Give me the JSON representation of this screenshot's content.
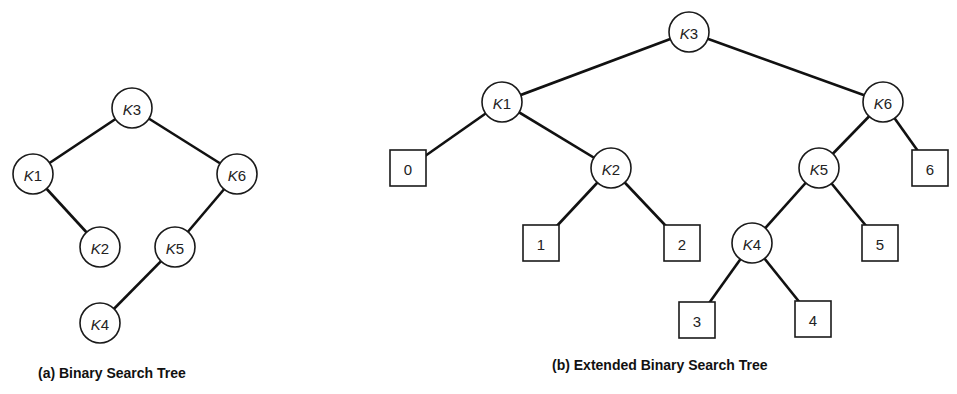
{
  "diagram_a": {
    "caption": "(a) Binary Search Tree",
    "nodes": [
      {
        "id": "K3",
        "prefix": "K",
        "num": "3",
        "x": 132,
        "y": 108
      },
      {
        "id": "K1",
        "prefix": "K",
        "num": "1",
        "x": 33,
        "y": 174
      },
      {
        "id": "K6",
        "prefix": "K",
        "num": "6",
        "x": 237,
        "y": 174
      },
      {
        "id": "K2",
        "prefix": "K",
        "num": "2",
        "x": 100,
        "y": 247
      },
      {
        "id": "K5",
        "prefix": "K",
        "num": "5",
        "x": 175,
        "y": 247
      },
      {
        "id": "K4",
        "prefix": "K",
        "num": "4",
        "x": 100,
        "y": 323
      }
    ],
    "edges": [
      [
        "K3",
        "K1"
      ],
      [
        "K3",
        "K6"
      ],
      [
        "K1",
        "K2"
      ],
      [
        "K6",
        "K5"
      ],
      [
        "K5",
        "K4"
      ]
    ]
  },
  "diagram_b": {
    "caption": "(b) Extended Binary Search Tree",
    "internal_nodes": [
      {
        "id": "K3",
        "prefix": "K",
        "num": "3",
        "x": 689,
        "y": 32
      },
      {
        "id": "K1",
        "prefix": "K",
        "num": "1",
        "x": 502,
        "y": 102
      },
      {
        "id": "K6",
        "prefix": "K",
        "num": "6",
        "x": 883,
        "y": 102
      },
      {
        "id": "K2",
        "prefix": "K",
        "num": "2",
        "x": 611,
        "y": 168
      },
      {
        "id": "K5",
        "prefix": "K",
        "num": "5",
        "x": 819,
        "y": 168
      },
      {
        "id": "K4",
        "prefix": "K",
        "num": "4",
        "x": 752,
        "y": 243
      }
    ],
    "external_nodes": [
      {
        "id": "0",
        "label": "0",
        "x": 408,
        "y": 168
      },
      {
        "id": "1",
        "label": "1",
        "x": 541,
        "y": 243
      },
      {
        "id": "2",
        "label": "2",
        "x": 682,
        "y": 243
      },
      {
        "id": "3",
        "label": "3",
        "x": 697,
        "y": 320
      },
      {
        "id": "4",
        "label": "4",
        "x": 813,
        "y": 319
      },
      {
        "id": "5",
        "label": "5",
        "x": 880,
        "y": 243
      },
      {
        "id": "6",
        "label": "6",
        "x": 930,
        "y": 168
      }
    ],
    "edges": [
      [
        "K3",
        "K1"
      ],
      [
        "K3",
        "K6"
      ],
      [
        "K1",
        "0"
      ],
      [
        "K1",
        "K2"
      ],
      [
        "K2",
        "1"
      ],
      [
        "K2",
        "2"
      ],
      [
        "K6",
        "K5"
      ],
      [
        "K6",
        "6"
      ],
      [
        "K5",
        "K4"
      ],
      [
        "K5",
        "5"
      ],
      [
        "K4",
        "3"
      ],
      [
        "K4",
        "4"
      ]
    ]
  },
  "style": {
    "line_color": "#111111",
    "node_fill": "#ffffff",
    "circle_radius": 20,
    "box_size": 36
  }
}
